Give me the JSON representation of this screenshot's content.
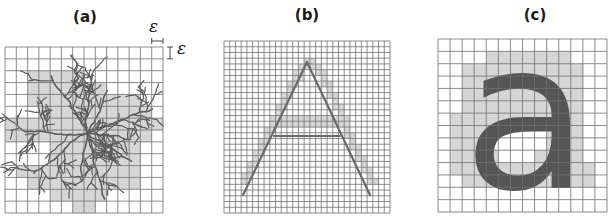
{
  "figure": {
    "panels": [
      {
        "id": "a",
        "label": "(a)",
        "label_x": 85,
        "label_y": 10,
        "x": 5,
        "y": 47,
        "width": 158,
        "height": 166,
        "cols": 14,
        "rows": 14,
        "content": "fractal-dendrite",
        "shaded_cells": [
          [
            2,
            2
          ],
          [
            3,
            2
          ],
          [
            4,
            2
          ],
          [
            5,
            2
          ],
          [
            6,
            2
          ],
          [
            2,
            3
          ],
          [
            3,
            3
          ],
          [
            4,
            3
          ],
          [
            5,
            3
          ],
          [
            6,
            3
          ],
          [
            7,
            3
          ],
          [
            8,
            3
          ],
          [
            2,
            4
          ],
          [
            3,
            4
          ],
          [
            4,
            4
          ],
          [
            5,
            4
          ],
          [
            6,
            4
          ],
          [
            7,
            4
          ],
          [
            8,
            4
          ],
          [
            9,
            4
          ],
          [
            10,
            4
          ],
          [
            11,
            4
          ],
          [
            3,
            5
          ],
          [
            4,
            5
          ],
          [
            5,
            5
          ],
          [
            6,
            5
          ],
          [
            7,
            5
          ],
          [
            8,
            5
          ],
          [
            9,
            5
          ],
          [
            10,
            5
          ],
          [
            11,
            5
          ],
          [
            12,
            5
          ],
          [
            0,
            6
          ],
          [
            1,
            6
          ],
          [
            2,
            6
          ],
          [
            3,
            6
          ],
          [
            4,
            6
          ],
          [
            5,
            6
          ],
          [
            6,
            6
          ],
          [
            7,
            6
          ],
          [
            8,
            6
          ],
          [
            9,
            6
          ],
          [
            10,
            6
          ],
          [
            11,
            6
          ],
          [
            12,
            6
          ],
          [
            13,
            6
          ],
          [
            0,
            7
          ],
          [
            1,
            7
          ],
          [
            2,
            7
          ],
          [
            3,
            7
          ],
          [
            4,
            7
          ],
          [
            5,
            7
          ],
          [
            6,
            7
          ],
          [
            7,
            7
          ],
          [
            8,
            7
          ],
          [
            9,
            7
          ],
          [
            10,
            7
          ],
          [
            11,
            7
          ],
          [
            12,
            7
          ],
          [
            4,
            8
          ],
          [
            5,
            8
          ],
          [
            6,
            8
          ],
          [
            7,
            8
          ],
          [
            8,
            8
          ],
          [
            9,
            8
          ],
          [
            10,
            8
          ],
          [
            11,
            8
          ],
          [
            4,
            9
          ],
          [
            5,
            9
          ],
          [
            6,
            9
          ],
          [
            7,
            9
          ],
          [
            8,
            9
          ],
          [
            9,
            9
          ],
          [
            10,
            9
          ],
          [
            11,
            9
          ],
          [
            1,
            10
          ],
          [
            2,
            10
          ],
          [
            3,
            10
          ],
          [
            4,
            10
          ],
          [
            5,
            10
          ],
          [
            6,
            10
          ],
          [
            7,
            10
          ],
          [
            8,
            10
          ],
          [
            9,
            10
          ],
          [
            10,
            10
          ],
          [
            11,
            10
          ],
          [
            2,
            11
          ],
          [
            3,
            11
          ],
          [
            4,
            11
          ],
          [
            5,
            11
          ],
          [
            6,
            11
          ],
          [
            7,
            11
          ],
          [
            8,
            11
          ],
          [
            9,
            11
          ],
          [
            10,
            11
          ],
          [
            11,
            11
          ],
          [
            4,
            12
          ],
          [
            5,
            12
          ],
          [
            6,
            12
          ],
          [
            7,
            12
          ],
          [
            8,
            12
          ],
          [
            6,
            13
          ],
          [
            7,
            13
          ]
        ],
        "annotations": {
          "epsilon_symbol": "ε",
          "epsilon_top_x": 155,
          "epsilon_top_y": 19,
          "epsilon_right_x": 176,
          "epsilon_right_y": 40
        }
      },
      {
        "id": "b",
        "label": "(b)",
        "label_x": 307,
        "label_y": 8,
        "x": 224,
        "y": 41,
        "width": 166,
        "height": 172,
        "cols": 29,
        "rows": 30,
        "content": "letter-A-outline",
        "stroke_lines": [
          [
            243,
            195,
            307,
            62
          ],
          [
            307,
            62,
            370,
            195
          ],
          [
            274,
            136,
            340,
            136
          ]
        ],
        "shaded_cells": [
          [
            14,
            3
          ],
          [
            15,
            3
          ],
          [
            13,
            4
          ],
          [
            14,
            4
          ],
          [
            15,
            4
          ],
          [
            16,
            4
          ],
          [
            12,
            5
          ],
          [
            13,
            5
          ],
          [
            16,
            5
          ],
          [
            17,
            5
          ],
          [
            12,
            6
          ],
          [
            13,
            6
          ],
          [
            17,
            6
          ],
          [
            11,
            7
          ],
          [
            12,
            7
          ],
          [
            17,
            7
          ],
          [
            18,
            7
          ],
          [
            11,
            8
          ],
          [
            18,
            8
          ],
          [
            10,
            9
          ],
          [
            11,
            9
          ],
          [
            18,
            9
          ],
          [
            19,
            9
          ],
          [
            10,
            10
          ],
          [
            19,
            10
          ],
          [
            9,
            11
          ],
          [
            10,
            11
          ],
          [
            19,
            11
          ],
          [
            20,
            11
          ],
          [
            9,
            12
          ],
          [
            20,
            12
          ],
          [
            8,
            13
          ],
          [
            9,
            13
          ],
          [
            10,
            13
          ],
          [
            11,
            13
          ],
          [
            12,
            13
          ],
          [
            13,
            13
          ],
          [
            14,
            13
          ],
          [
            15,
            13
          ],
          [
            16,
            13
          ],
          [
            17,
            13
          ],
          [
            18,
            13
          ],
          [
            19,
            13
          ],
          [
            20,
            13
          ],
          [
            21,
            13
          ],
          [
            8,
            14
          ],
          [
            9,
            14
          ],
          [
            10,
            14
          ],
          [
            11,
            14
          ],
          [
            12,
            14
          ],
          [
            13,
            14
          ],
          [
            14,
            14
          ],
          [
            15,
            14
          ],
          [
            16,
            14
          ],
          [
            17,
            14
          ],
          [
            18,
            14
          ],
          [
            19,
            14
          ],
          [
            20,
            14
          ],
          [
            21,
            14
          ],
          [
            7,
            15
          ],
          [
            8,
            15
          ],
          [
            21,
            15
          ],
          [
            7,
            16
          ],
          [
            21,
            16
          ],
          [
            22,
            16
          ],
          [
            6,
            17
          ],
          [
            7,
            17
          ],
          [
            22,
            17
          ],
          [
            6,
            18
          ],
          [
            22,
            18
          ],
          [
            23,
            18
          ],
          [
            5,
            19
          ],
          [
            6,
            19
          ],
          [
            23,
            19
          ],
          [
            5,
            20
          ],
          [
            23,
            20
          ],
          [
            24,
            20
          ],
          [
            4,
            21
          ],
          [
            5,
            21
          ],
          [
            24,
            21
          ],
          [
            4,
            22
          ],
          [
            24,
            22
          ],
          [
            25,
            22
          ],
          [
            3,
            23
          ],
          [
            4,
            23
          ],
          [
            25,
            23
          ],
          [
            3,
            24
          ],
          [
            25,
            24
          ],
          [
            26,
            24
          ]
        ]
      },
      {
        "id": "c",
        "label": "(c)",
        "label_x": 535,
        "label_y": 8,
        "x": 438,
        "y": 39,
        "width": 169,
        "height": 173,
        "cols": 14,
        "rows": 14,
        "content": "letter-a-glyph",
        "glyph": "a",
        "shaded_cells": [
          [
            4,
            1
          ],
          [
            5,
            1
          ],
          [
            6,
            1
          ],
          [
            7,
            1
          ],
          [
            8,
            1
          ],
          [
            9,
            1
          ],
          [
            10,
            1
          ],
          [
            2,
            2
          ],
          [
            3,
            2
          ],
          [
            4,
            2
          ],
          [
            5,
            2
          ],
          [
            6,
            2
          ],
          [
            7,
            2
          ],
          [
            8,
            2
          ],
          [
            9,
            2
          ],
          [
            10,
            2
          ],
          [
            11,
            2
          ],
          [
            2,
            3
          ],
          [
            3,
            3
          ],
          [
            4,
            3
          ],
          [
            8,
            3
          ],
          [
            9,
            3
          ],
          [
            10,
            3
          ],
          [
            11,
            3
          ],
          [
            2,
            4
          ],
          [
            3,
            4
          ],
          [
            4,
            4
          ],
          [
            5,
            4
          ],
          [
            6,
            4
          ],
          [
            7,
            4
          ],
          [
            8,
            4
          ],
          [
            9,
            4
          ],
          [
            10,
            4
          ],
          [
            11,
            4
          ],
          [
            2,
            5
          ],
          [
            3,
            5
          ],
          [
            4,
            5
          ],
          [
            5,
            5
          ],
          [
            6,
            5
          ],
          [
            7,
            5
          ],
          [
            8,
            5
          ],
          [
            9,
            5
          ],
          [
            10,
            5
          ],
          [
            11,
            5
          ],
          [
            1,
            6
          ],
          [
            2,
            6
          ],
          [
            3,
            6
          ],
          [
            4,
            6
          ],
          [
            5,
            6
          ],
          [
            6,
            6
          ],
          [
            7,
            6
          ],
          [
            8,
            6
          ],
          [
            9,
            6
          ],
          [
            10,
            6
          ],
          [
            11,
            6
          ],
          [
            1,
            7
          ],
          [
            2,
            7
          ],
          [
            3,
            7
          ],
          [
            4,
            7
          ],
          [
            9,
            7
          ],
          [
            10,
            7
          ],
          [
            11,
            7
          ],
          [
            1,
            8
          ],
          [
            2,
            8
          ],
          [
            3,
            8
          ],
          [
            9,
            8
          ],
          [
            10,
            8
          ],
          [
            11,
            8
          ],
          [
            1,
            9
          ],
          [
            2,
            9
          ],
          [
            3,
            9
          ],
          [
            4,
            9
          ],
          [
            8,
            9
          ],
          [
            9,
            9
          ],
          [
            10,
            9
          ],
          [
            11,
            9
          ],
          [
            1,
            10
          ],
          [
            2,
            10
          ],
          [
            3,
            10
          ],
          [
            4,
            10
          ],
          [
            5,
            10
          ],
          [
            6,
            10
          ],
          [
            7,
            10
          ],
          [
            8,
            10
          ],
          [
            9,
            10
          ],
          [
            10,
            10
          ],
          [
            11,
            10
          ],
          [
            12,
            10
          ],
          [
            2,
            11
          ],
          [
            3,
            11
          ],
          [
            4,
            11
          ],
          [
            5,
            11
          ],
          [
            6,
            11
          ],
          [
            7,
            11
          ],
          [
            8,
            11
          ],
          [
            9,
            11
          ],
          [
            10,
            11
          ],
          [
            11,
            11
          ],
          [
            12,
            11
          ]
        ]
      }
    ],
    "colors": {
      "grid_line": "#707070",
      "shade": "#d6d6d6",
      "ink": "#5a5a5a",
      "glyph": "#555555",
      "label": "#1a1a1a"
    }
  }
}
